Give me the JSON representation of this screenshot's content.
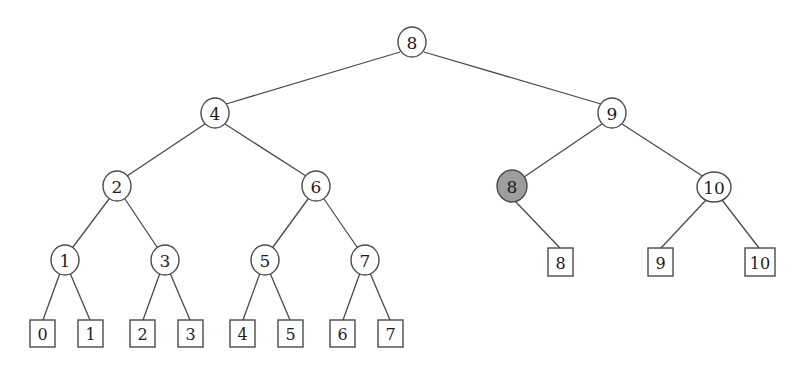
{
  "diagram": {
    "type": "binary-tree",
    "background_color": "#ffffff",
    "stroke_color": "#4a4a4a",
    "text_color": "#1d1d1d",
    "highlight_color": "#9d9d9d",
    "node_fill_color": "#ffffff",
    "internal_nodes": [
      {
        "id": "n8",
        "label": "8",
        "cx": 412,
        "cy": 42,
        "rx": 14,
        "ry": 15,
        "highlighted": false,
        "level": 0
      },
      {
        "id": "n4",
        "label": "4",
        "cx": 215,
        "cy": 113,
        "rx": 14,
        "ry": 15,
        "highlighted": false,
        "level": 1
      },
      {
        "id": "n9",
        "label": "9",
        "cx": 612,
        "cy": 113,
        "rx": 14,
        "ry": 15,
        "highlighted": false,
        "level": 1
      },
      {
        "id": "n2",
        "label": "2",
        "cx": 117,
        "cy": 186,
        "rx": 14,
        "ry": 15,
        "highlighted": false,
        "level": 2
      },
      {
        "id": "n6",
        "label": "6",
        "cx": 316,
        "cy": 186,
        "rx": 14,
        "ry": 15,
        "highlighted": false,
        "level": 2
      },
      {
        "id": "n8h",
        "label": "8",
        "cx": 512,
        "cy": 186,
        "rx": 15,
        "ry": 16,
        "highlighted": true,
        "level": 2
      },
      {
        "id": "n10",
        "label": "10",
        "cx": 714,
        "cy": 187,
        "rx": 17,
        "ry": 15,
        "highlighted": false,
        "level": 2
      },
      {
        "id": "n1",
        "label": "1",
        "cx": 65,
        "cy": 260,
        "rx": 14,
        "ry": 15,
        "highlighted": false,
        "level": 3
      },
      {
        "id": "n3",
        "label": "3",
        "cx": 165,
        "cy": 260,
        "rx": 14,
        "ry": 15,
        "highlighted": false,
        "level": 3
      },
      {
        "id": "n5",
        "label": "5",
        "cx": 265,
        "cy": 260,
        "rx": 14,
        "ry": 15,
        "highlighted": false,
        "level": 3
      },
      {
        "id": "n7",
        "label": "7",
        "cx": 365,
        "cy": 260,
        "rx": 14,
        "ry": 15,
        "highlighted": false,
        "level": 3
      }
    ],
    "leaf_nodes": [
      {
        "id": "l0",
        "label": "0",
        "x": 30,
        "y": 320,
        "w": 25,
        "h": 27
      },
      {
        "id": "l1",
        "label": "1",
        "x": 78,
        "y": 320,
        "w": 25,
        "h": 27
      },
      {
        "id": "l2",
        "label": "2",
        "x": 130,
        "y": 320,
        "w": 25,
        "h": 27
      },
      {
        "id": "l3",
        "label": "3",
        "x": 178,
        "y": 320,
        "w": 25,
        "h": 27
      },
      {
        "id": "l4",
        "label": "4",
        "x": 230,
        "y": 320,
        "w": 25,
        "h": 27
      },
      {
        "id": "l5",
        "label": "5",
        "x": 278,
        "y": 320,
        "w": 25,
        "h": 27
      },
      {
        "id": "l6",
        "label": "6",
        "x": 330,
        "y": 320,
        "w": 25,
        "h": 27
      },
      {
        "id": "l7",
        "label": "7",
        "x": 378,
        "y": 320,
        "w": 25,
        "h": 27
      },
      {
        "id": "l8",
        "label": "8",
        "x": 548,
        "y": 248,
        "w": 25,
        "h": 28
      },
      {
        "id": "l9",
        "label": "9",
        "x": 648,
        "y": 248,
        "w": 25,
        "h": 28
      },
      {
        "id": "l10",
        "label": "10",
        "x": 745,
        "y": 248,
        "w": 30,
        "h": 28
      }
    ],
    "edges": [
      {
        "id": "e-n8-n4",
        "from": "n8",
        "to": "n4",
        "x1": 400,
        "y1": 52,
        "x2": 226,
        "y2": 104
      },
      {
        "id": "e-n8-n9",
        "from": "n8",
        "to": "n9",
        "x1": 424,
        "y1": 52,
        "x2": 601,
        "y2": 104
      },
      {
        "id": "e-n4-n2",
        "from": "n4",
        "to": "n2",
        "x1": 205,
        "y1": 124,
        "x2": 127,
        "y2": 176
      },
      {
        "id": "e-n4-n6",
        "from": "n4",
        "to": "n6",
        "x1": 225,
        "y1": 124,
        "x2": 306,
        "y2": 176
      },
      {
        "id": "e-n9-n8h",
        "from": "n9",
        "to": "n8h",
        "x1": 602,
        "y1": 124,
        "x2": 524,
        "y2": 177
      },
      {
        "id": "e-n9-n10",
        "from": "n9",
        "to": "n10",
        "x1": 622,
        "y1": 124,
        "x2": 704,
        "y2": 177
      },
      {
        "id": "e-n2-n1",
        "from": "n2",
        "to": "n1",
        "x1": 109,
        "y1": 199,
        "x2": 73,
        "y2": 247
      },
      {
        "id": "e-n2-n3",
        "from": "n2",
        "to": "n3",
        "x1": 125,
        "y1": 199,
        "x2": 157,
        "y2": 247
      },
      {
        "id": "e-n6-n5",
        "from": "n6",
        "to": "n5",
        "x1": 308,
        "y1": 199,
        "x2": 273,
        "y2": 247
      },
      {
        "id": "e-n6-n7",
        "from": "n6",
        "to": "n7",
        "x1": 324,
        "y1": 199,
        "x2": 357,
        "y2": 247
      },
      {
        "id": "e-n1-l0",
        "from": "n1",
        "to": "l0",
        "x1": 60,
        "y1": 273,
        "x2": 43,
        "y2": 320
      },
      {
        "id": "e-n1-l1",
        "from": "n1",
        "to": "l1",
        "x1": 70,
        "y1": 273,
        "x2": 90,
        "y2": 320
      },
      {
        "id": "e-n3-l2",
        "from": "n3",
        "to": "l2",
        "x1": 160,
        "y1": 273,
        "x2": 143,
        "y2": 320
      },
      {
        "id": "e-n3-l3",
        "from": "n3",
        "to": "l3",
        "x1": 170,
        "y1": 273,
        "x2": 190,
        "y2": 320
      },
      {
        "id": "e-n5-l4",
        "from": "n5",
        "to": "l4",
        "x1": 260,
        "y1": 273,
        "x2": 243,
        "y2": 320
      },
      {
        "id": "e-n5-l5",
        "from": "n5",
        "to": "l5",
        "x1": 270,
        "y1": 273,
        "x2": 290,
        "y2": 320
      },
      {
        "id": "e-n7-l6",
        "from": "n7",
        "to": "l6",
        "x1": 360,
        "y1": 273,
        "x2": 343,
        "y2": 320
      },
      {
        "id": "e-n7-l7",
        "from": "n7",
        "to": "l7",
        "x1": 370,
        "y1": 273,
        "x2": 390,
        "y2": 320
      },
      {
        "id": "e-n8h-l8",
        "from": "n8h",
        "to": "l8",
        "x1": 515,
        "y1": 201,
        "x2": 560,
        "y2": 248
      },
      {
        "id": "e-n10-l9",
        "from": "n10",
        "to": "l9",
        "x1": 706,
        "y1": 200,
        "x2": 661,
        "y2": 248
      },
      {
        "id": "e-n10-l10",
        "from": "n10",
        "to": "l10",
        "x1": 722,
        "y1": 200,
        "x2": 759,
        "y2": 248
      }
    ]
  }
}
